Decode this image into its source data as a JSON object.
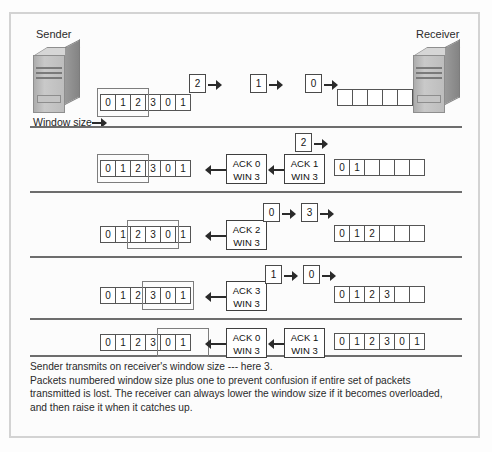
{
  "figure": {
    "sender_label": "Sender",
    "receiver_label": "Receiver",
    "window_size_label": "Window size",
    "caption_lines": [
      "Sender transmits on receiver's window size --- here 3.",
      "Packets numbered window size plus one to prevent confusion if entire set of packets transmitted is lost. The receiver can always lower the window size if it becomes overloaded, and then raise it when it catches up."
    ],
    "colors": {
      "frame_border": "#d3d3d3",
      "separator": "#6d6d6d",
      "cell_border": "#555555",
      "arrow": "#2b2b2b",
      "text": "#2a2a2a",
      "tower_body": "#bdbdbd"
    },
    "rows": [
      {
        "id": "row-1",
        "sender_strip": [
          "0",
          "1",
          "2",
          "3",
          "0",
          "1"
        ],
        "sender_window": {
          "start_index": 0,
          "span": 3
        },
        "packets_in_flight": [
          "2",
          "1",
          "0"
        ],
        "acks_in_flight": [],
        "receiver_strip": [
          "",
          "",
          "",
          "",
          ""
        ]
      },
      {
        "id": "row-2",
        "sender_strip": [
          "0",
          "1",
          "2",
          "3",
          "0",
          "1"
        ],
        "sender_window": {
          "start_index": 0,
          "span": 3
        },
        "packets_in_flight": [
          "2"
        ],
        "acks_in_flight": [
          {
            "ack": "ACK 0",
            "win": "WIN 3"
          },
          {
            "ack": "ACK 1",
            "win": "WIN 3"
          }
        ],
        "receiver_strip": [
          "0",
          "1",
          "",
          "",
          "",
          ""
        ]
      },
      {
        "id": "row-3",
        "sender_strip": [
          "0",
          "1",
          "2",
          "3",
          "0",
          "1"
        ],
        "sender_window": {
          "start_index": 2,
          "span": 3
        },
        "packets_in_flight": [
          "0",
          "3"
        ],
        "acks_in_flight": [
          {
            "ack": "ACK 2",
            "win": "WIN 3"
          }
        ],
        "receiver_strip": [
          "0",
          "1",
          "2",
          "",
          "",
          ""
        ]
      },
      {
        "id": "row-4",
        "sender_strip": [
          "0",
          "1",
          "2",
          "3",
          "0",
          "1"
        ],
        "sender_window": {
          "start_index": 3,
          "span": 3
        },
        "packets_in_flight": [
          "1",
          "0"
        ],
        "acks_in_flight": [
          {
            "ack": "ACK 3",
            "win": "WIN 3"
          }
        ],
        "receiver_strip": [
          "0",
          "1",
          "2",
          "3",
          "",
          ""
        ]
      },
      {
        "id": "row-5",
        "sender_strip": [
          "0",
          "1",
          "2",
          "3",
          "0",
          "1"
        ],
        "sender_window": {
          "start_index": 4,
          "span": 3
        },
        "packets_in_flight": [],
        "acks_in_flight": [
          {
            "ack": "ACK 0",
            "win": "WIN 3"
          },
          {
            "ack": "ACK 1",
            "win": "WIN 3"
          }
        ],
        "receiver_strip": [
          "0",
          "1",
          "2",
          "3",
          "0",
          "1"
        ]
      }
    ]
  }
}
